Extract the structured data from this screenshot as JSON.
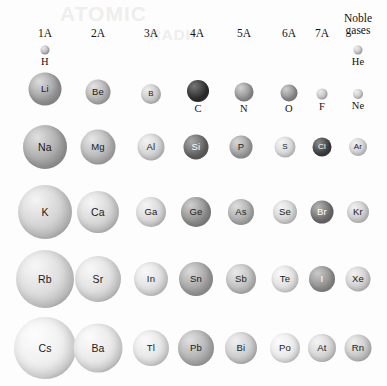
{
  "figure": {
    "title_bleed_1": "ATOMIC",
    "title_bleed_2": "RADII"
  },
  "columns": [
    {
      "id": "1A",
      "lines": [
        "1A"
      ],
      "cx": 45
    },
    {
      "id": "2A",
      "lines": [
        "2A"
      ],
      "cx": 98
    },
    {
      "id": "3A",
      "lines": [
        "3A"
      ],
      "cx": 151
    },
    {
      "id": "4A",
      "lines": [
        "4A"
      ],
      "cx": 197
    },
    {
      "id": "5A",
      "lines": [
        "5A"
      ],
      "cx": 244
    },
    {
      "id": "6A",
      "lines": [
        "6A"
      ],
      "cx": 289
    },
    {
      "id": "7A",
      "lines": [
        "7A"
      ],
      "cx": 322
    },
    {
      "id": "noble",
      "lines": [
        "Noble",
        "gases"
      ],
      "cx": 358
    }
  ],
  "chart_data": {
    "type": "scatter",
    "xlabel": "Main group (periodic table family)",
    "ylabel": "Period",
    "encoding": "Circle diameter is proportional to the atomic radius of the element; darker shading marks the metalloid / nonmetal spheres.",
    "grid": false,
    "legend": null,
    "categories": [
      "1A",
      "2A",
      "3A",
      "4A",
      "5A",
      "6A",
      "7A",
      "Noble gases"
    ],
    "periods": [
      1,
      2,
      3,
      4,
      5,
      6
    ],
    "points": [
      {
        "symbol": "H",
        "group": "1A",
        "period": 1,
        "cx": 45,
        "cy": 50,
        "d": 9,
        "fill": "#b9b9b9",
        "hi": "#e8e8e8",
        "label_pos": "below",
        "label_color": "dark"
      },
      {
        "symbol": "He",
        "group": "noble",
        "period": 1,
        "cx": 358,
        "cy": 50,
        "d": 9,
        "fill": "#c4c4c4",
        "hi": "#ececec",
        "label_pos": "below",
        "label_color": "dark"
      },
      {
        "symbol": "Li",
        "group": "1A",
        "period": 2,
        "cx": 45,
        "cy": 89,
        "d": 33,
        "fill": "#9a9a9a",
        "hi": "#dcdcdc",
        "label_pos": "inside",
        "label_color": "dark"
      },
      {
        "symbol": "Be",
        "group": "2A",
        "period": 2,
        "cx": 98,
        "cy": 92,
        "d": 25,
        "fill": "#b0b0b0",
        "hi": "#e3e3e3",
        "label_pos": "inside",
        "label_color": "dark"
      },
      {
        "symbol": "B",
        "group": "3A",
        "period": 2,
        "cx": 151,
        "cy": 94,
        "d": 20,
        "fill": "#c6c6c6",
        "hi": "#eeeeee",
        "label_pos": "inside",
        "label_color": "dark"
      },
      {
        "symbol": "C",
        "group": "4A",
        "period": 2,
        "cx": 198,
        "cy": 91,
        "d": 22,
        "fill": "#2e2e2e",
        "hi": "#767676",
        "label_pos": "below",
        "label_color": "dark"
      },
      {
        "symbol": "N",
        "group": "5A",
        "period": 2,
        "cx": 244,
        "cy": 92,
        "d": 19,
        "fill": "#8f8f8f",
        "hi": "#d2d2d2",
        "label_pos": "below",
        "label_color": "dark"
      },
      {
        "symbol": "O",
        "group": "6A",
        "period": 2,
        "cx": 289,
        "cy": 93,
        "d": 17,
        "fill": "#898989",
        "hi": "#cfcfcf",
        "label_pos": "below",
        "label_color": "dark"
      },
      {
        "symbol": "F",
        "group": "7A",
        "period": 2,
        "cx": 322,
        "cy": 94,
        "d": 11,
        "fill": "#c2c2c2",
        "hi": "#ebebeb",
        "label_pos": "below",
        "label_color": "dark"
      },
      {
        "symbol": "Ne",
        "group": "noble",
        "period": 2,
        "cx": 358,
        "cy": 94,
        "d": 10,
        "fill": "#c8c8c8",
        "hi": "#efefef",
        "label_pos": "below",
        "label_color": "dark"
      },
      {
        "symbol": "Na",
        "group": "1A",
        "period": 3,
        "cx": 45,
        "cy": 147,
        "d": 44,
        "fill": "#a3a3a3",
        "hi": "#e0e0e0",
        "label_pos": "inside",
        "label_color": "dark"
      },
      {
        "symbol": "Mg",
        "group": "2A",
        "period": 3,
        "cx": 98,
        "cy": 147,
        "d": 35,
        "fill": "#b4b4b4",
        "hi": "#e6e6e6",
        "label_pos": "inside",
        "label_color": "dark"
      },
      {
        "symbol": "Al",
        "group": "3A",
        "period": 3,
        "cx": 151,
        "cy": 147,
        "d": 27,
        "fill": "#d0d0d0",
        "hi": "#f3f3f3",
        "label_pos": "inside",
        "label_color": "dark"
      },
      {
        "symbol": "Si",
        "group": "4A",
        "period": 3,
        "cx": 196,
        "cy": 147,
        "d": 25,
        "fill": "#626262",
        "hi": "#a8a8a8",
        "label_pos": "inside",
        "label_color": "light"
      },
      {
        "symbol": "P",
        "group": "5A",
        "period": 3,
        "cx": 241,
        "cy": 147,
        "d": 23,
        "fill": "#9e9e9e",
        "hi": "#d8d8d8",
        "label_pos": "inside",
        "label_color": "dark"
      },
      {
        "symbol": "S",
        "group": "6A",
        "period": 3,
        "cx": 285,
        "cy": 147,
        "d": 21,
        "fill": "#d6d6d6",
        "hi": "#f5f5f5",
        "label_pos": "inside",
        "label_color": "dark"
      },
      {
        "symbol": "Cl",
        "group": "7A",
        "period": 3,
        "cx": 322,
        "cy": 147,
        "d": 19,
        "fill": "#3d3d3d",
        "hi": "#8a8a8a",
        "label_pos": "inside",
        "label_color": "light"
      },
      {
        "symbol": "Ar",
        "group": "noble",
        "period": 3,
        "cx": 358,
        "cy": 147,
        "d": 18,
        "fill": "#cfcfcf",
        "hi": "#f1f1f1",
        "label_pos": "inside",
        "label_color": "dark"
      },
      {
        "symbol": "K",
        "group": "1A",
        "period": 4,
        "cx": 45,
        "cy": 212,
        "d": 54,
        "fill": "#cecece",
        "hi": "#f4f4f4",
        "label_pos": "inside",
        "label_color": "dark"
      },
      {
        "symbol": "Ca",
        "group": "2A",
        "period": 4,
        "cx": 98,
        "cy": 212,
        "d": 42,
        "fill": "#d2d2d2",
        "hi": "#f5f5f5",
        "label_pos": "inside",
        "label_color": "dark"
      },
      {
        "symbol": "Ga",
        "group": "3A",
        "period": 4,
        "cx": 151,
        "cy": 212,
        "d": 30,
        "fill": "#d5d5d5",
        "hi": "#f5f5f5",
        "label_pos": "inside",
        "label_color": "dark"
      },
      {
        "symbol": "Ge",
        "group": "4A",
        "period": 4,
        "cx": 196,
        "cy": 212,
        "d": 30,
        "fill": "#8c8c8c",
        "hi": "#cfcfcf",
        "label_pos": "inside",
        "label_color": "dark"
      },
      {
        "symbol": "As",
        "group": "5A",
        "period": 4,
        "cx": 241,
        "cy": 212,
        "d": 26,
        "fill": "#aaaaaa",
        "hi": "#dedede",
        "label_pos": "inside",
        "label_color": "dark"
      },
      {
        "symbol": "Se",
        "group": "6A",
        "period": 4,
        "cx": 285,
        "cy": 212,
        "d": 24,
        "fill": "#d4d4d4",
        "hi": "#f4f4f4",
        "label_pos": "inside",
        "label_color": "dark"
      },
      {
        "symbol": "Br",
        "group": "7A",
        "period": 4,
        "cx": 322,
        "cy": 212,
        "d": 23,
        "fill": "#6e6e6e",
        "hi": "#b4b4b4",
        "label_pos": "inside",
        "label_color": "light"
      },
      {
        "symbol": "Kr",
        "group": "noble",
        "period": 4,
        "cx": 358,
        "cy": 212,
        "d": 22,
        "fill": "#cbcbcb",
        "hi": "#f0f0f0",
        "label_pos": "inside",
        "label_color": "dark"
      },
      {
        "symbol": "Rb",
        "group": "1A",
        "period": 5,
        "cx": 45,
        "cy": 279,
        "d": 58,
        "fill": "#d8d8d8",
        "hi": "#f7f7f7",
        "label_pos": "inside",
        "label_color": "dark"
      },
      {
        "symbol": "Sr",
        "group": "2A",
        "period": 5,
        "cx": 98,
        "cy": 279,
        "d": 46,
        "fill": "#dcdcdc",
        "hi": "#f8f8f8",
        "label_pos": "inside",
        "label_color": "dark"
      },
      {
        "symbol": "In",
        "group": "3A",
        "period": 5,
        "cx": 151,
        "cy": 279,
        "d": 34,
        "fill": "#dedede",
        "hi": "#f8f8f8",
        "label_pos": "inside",
        "label_color": "dark"
      },
      {
        "symbol": "Sn",
        "group": "4A",
        "period": 5,
        "cx": 196,
        "cy": 279,
        "d": 34,
        "fill": "#a0a0a0",
        "hi": "#dadada",
        "label_pos": "inside",
        "label_color": "dark"
      },
      {
        "symbol": "Sb",
        "group": "5A",
        "period": 5,
        "cx": 241,
        "cy": 279,
        "d": 30,
        "fill": "#bdbdbd",
        "hi": "#e9e9e9",
        "label_pos": "inside",
        "label_color": "dark"
      },
      {
        "symbol": "Te",
        "group": "6A",
        "period": 5,
        "cx": 285,
        "cy": 279,
        "d": 27,
        "fill": "#e0e0e0",
        "hi": "#f9f9f9",
        "label_pos": "inside",
        "label_color": "dark"
      },
      {
        "symbol": "I",
        "group": "7A",
        "period": 5,
        "cx": 322,
        "cy": 279,
        "d": 26,
        "fill": "#8d8d8d",
        "hi": "#cacaca",
        "label_pos": "inside",
        "label_color": "light"
      },
      {
        "symbol": "Xe",
        "group": "noble",
        "period": 5,
        "cx": 358,
        "cy": 279,
        "d": 25,
        "fill": "#cfcfcf",
        "hi": "#f2f2f2",
        "label_pos": "inside",
        "label_color": "dark"
      },
      {
        "symbol": "Cs",
        "group": "1A",
        "period": 6,
        "cx": 45,
        "cy": 348,
        "d": 62,
        "fill": "#ededed",
        "hi": "#fdfdfd",
        "label_pos": "inside",
        "label_color": "dark"
      },
      {
        "symbol": "Ba",
        "group": "2A",
        "period": 6,
        "cx": 98,
        "cy": 348,
        "d": 49,
        "fill": "#e6e6e6",
        "hi": "#fbfbfb",
        "label_pos": "inside",
        "label_color": "dark"
      },
      {
        "symbol": "Tl",
        "group": "3A",
        "period": 6,
        "cx": 151,
        "cy": 348,
        "d": 36,
        "fill": "#e4e4e4",
        "hi": "#fafafa",
        "label_pos": "inside",
        "label_color": "dark"
      },
      {
        "symbol": "Pb",
        "group": "4A",
        "period": 6,
        "cx": 196,
        "cy": 348,
        "d": 36,
        "fill": "#aeaeae",
        "hi": "#e0e0e0",
        "label_pos": "inside",
        "label_color": "dark"
      },
      {
        "symbol": "Bi",
        "group": "5A",
        "period": 6,
        "cx": 241,
        "cy": 348,
        "d": 32,
        "fill": "#cacaca",
        "hi": "#f0f0f0",
        "label_pos": "inside",
        "label_color": "dark"
      },
      {
        "symbol": "Po",
        "group": "6A",
        "period": 6,
        "cx": 285,
        "cy": 348,
        "d": 30,
        "fill": "#e8e8e8",
        "hi": "#fcfcfc",
        "label_pos": "inside",
        "label_color": "dark"
      },
      {
        "symbol": "At",
        "group": "7A",
        "period": 6,
        "cx": 322,
        "cy": 348,
        "d": 28,
        "fill": "#d3d3d3",
        "hi": "#f4f4f4",
        "label_pos": "inside",
        "label_color": "dark"
      },
      {
        "symbol": "Rn",
        "group": "noble",
        "period": 6,
        "cx": 358,
        "cy": 348,
        "d": 27,
        "fill": "#c6c6c6",
        "hi": "#efefef",
        "label_pos": "inside",
        "label_color": "dark"
      }
    ]
  }
}
